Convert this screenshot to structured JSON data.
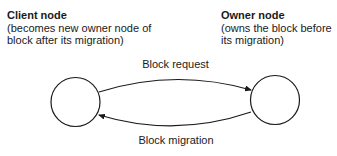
{
  "nodes": {
    "client": {
      "title": "Client node",
      "description_line1": "(becomes new owner node of",
      "description_line2": "block after its migration)"
    },
    "owner": {
      "title": "Owner node",
      "description_line1": "(owns the block before",
      "description_line2": "its migration)"
    }
  },
  "edges": {
    "request": {
      "label": "Block request",
      "from": "client",
      "to": "owner"
    },
    "migration": {
      "label": "Block migration",
      "from": "owner",
      "to": "client"
    }
  },
  "colors": {
    "stroke": "#1a1a1a",
    "background": "#ffffff"
  }
}
